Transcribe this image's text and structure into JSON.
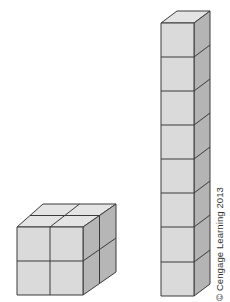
{
  "figure": {
    "colors": {
      "front_face": "#dcdcdc",
      "top_face": "#e4e4e4",
      "side_face": "#b4b4b4",
      "edge": "#3a3a3a"
    },
    "shapes": [
      {
        "name": "cube-2x2x2",
        "cube_count": 8,
        "width": 2,
        "height": 2,
        "depth": 2
      },
      {
        "name": "tower-1x1x8",
        "cube_count": 8,
        "width": 1,
        "height": 8,
        "depth": 1
      }
    ]
  },
  "credit": {
    "text": "© Cengage Learning 2013"
  }
}
